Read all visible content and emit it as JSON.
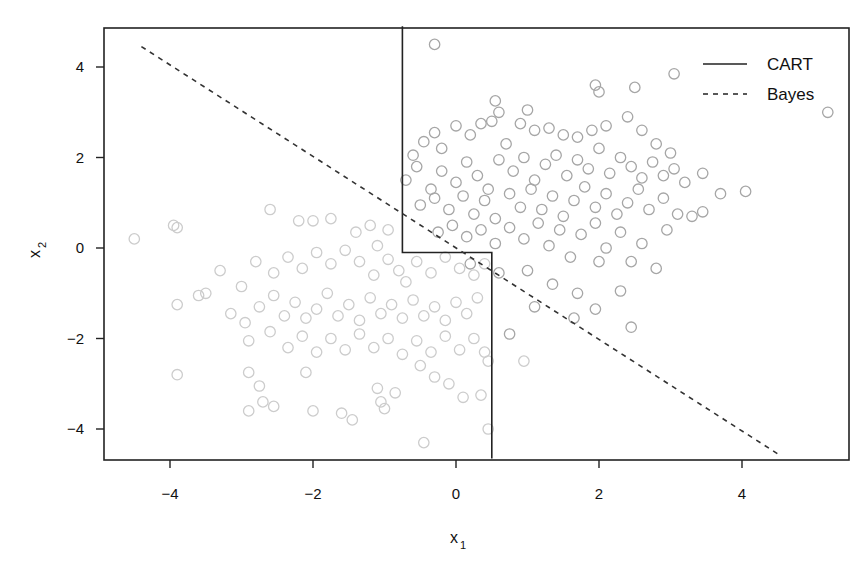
{
  "chart_data": {
    "type": "scatter",
    "title": "",
    "xlabel": "x",
    "xlabel_sub": "1",
    "ylabel": "x",
    "ylabel_sub": "2",
    "xlim": [
      -4.95,
      5.45
    ],
    "ylim": [
      -4.65,
      4.9
    ],
    "xticks": [
      -4,
      -2,
      0,
      2,
      4
    ],
    "xtick_labels": [
      "−4",
      "−2",
      "0",
      "2",
      "4"
    ],
    "yticks": [
      -4,
      -2,
      0,
      2,
      4
    ],
    "ytick_labels": [
      "−4",
      "−2",
      "0",
      "2",
      "4"
    ],
    "grid": false,
    "legend": {
      "position": "top-right",
      "entries": [
        {
          "label": "CART",
          "style": "solid"
        },
        {
          "label": "Bayes",
          "style": "dashed"
        }
      ]
    },
    "lines": [
      {
        "name": "CART",
        "style": "solid",
        "color": "#222222",
        "points": [
          [
            -0.75,
            4.9
          ],
          [
            -0.75,
            -0.1
          ],
          [
            0.5,
            -0.1
          ],
          [
            0.5,
            -4.65
          ]
        ]
      },
      {
        "name": "Bayes",
        "style": "dashed",
        "color": "#333333",
        "points": [
          [
            -4.4,
            4.45
          ],
          [
            4.55,
            -4.6
          ]
        ]
      }
    ],
    "series": [
      {
        "name": "class 1 (upper right)",
        "color": "#a6a6a6",
        "points": [
          [
            -0.3,
            4.5
          ],
          [
            0.55,
            3.25
          ],
          [
            0.6,
            3.0
          ],
          [
            1.0,
            3.05
          ],
          [
            1.95,
            3.6
          ],
          [
            2.0,
            3.45
          ],
          [
            2.5,
            3.55
          ],
          [
            3.05,
            3.85
          ],
          [
            5.2,
            3.0
          ],
          [
            -0.6,
            2.05
          ],
          [
            -0.45,
            2.35
          ],
          [
            -0.3,
            2.55
          ],
          [
            -0.2,
            2.2
          ],
          [
            0.0,
            2.7
          ],
          [
            0.2,
            2.5
          ],
          [
            0.35,
            2.75
          ],
          [
            0.5,
            2.8
          ],
          [
            0.7,
            2.3
          ],
          [
            0.9,
            2.75
          ],
          [
            1.1,
            2.6
          ],
          [
            1.3,
            2.65
          ],
          [
            1.5,
            2.5
          ],
          [
            1.7,
            2.45
          ],
          [
            1.9,
            2.6
          ],
          [
            2.1,
            2.7
          ],
          [
            2.4,
            2.9
          ],
          [
            2.6,
            2.6
          ],
          [
            2.8,
            2.3
          ],
          [
            3.0,
            2.1
          ],
          [
            -0.7,
            1.5
          ],
          [
            -0.55,
            1.8
          ],
          [
            -0.35,
            1.3
          ],
          [
            -0.2,
            1.7
          ],
          [
            0.0,
            1.45
          ],
          [
            0.15,
            1.9
          ],
          [
            0.3,
            1.6
          ],
          [
            0.45,
            1.3
          ],
          [
            0.6,
            1.95
          ],
          [
            0.8,
            1.7
          ],
          [
            0.95,
            2.0
          ],
          [
            1.1,
            1.5
          ],
          [
            1.25,
            1.85
          ],
          [
            1.4,
            2.05
          ],
          [
            1.55,
            1.6
          ],
          [
            1.7,
            1.95
          ],
          [
            1.85,
            1.75
          ],
          [
            2.0,
            2.2
          ],
          [
            2.15,
            1.65
          ],
          [
            2.3,
            2.0
          ],
          [
            2.45,
            1.8
          ],
          [
            2.6,
            1.55
          ],
          [
            2.75,
            1.9
          ],
          [
            2.9,
            1.6
          ],
          [
            3.05,
            1.75
          ],
          [
            3.2,
            1.45
          ],
          [
            3.45,
            1.65
          ],
          [
            3.7,
            1.2
          ],
          [
            4.05,
            1.25
          ],
          [
            -0.5,
            0.95
          ],
          [
            -0.3,
            1.1
          ],
          [
            -0.1,
            0.85
          ],
          [
            0.1,
            1.15
          ],
          [
            0.25,
            0.75
          ],
          [
            0.4,
            1.05
          ],
          [
            0.55,
            0.65
          ],
          [
            0.75,
            1.2
          ],
          [
            0.9,
            0.9
          ],
          [
            1.05,
            1.3
          ],
          [
            1.2,
            0.85
          ],
          [
            1.35,
            1.15
          ],
          [
            1.5,
            0.7
          ],
          [
            1.65,
            1.05
          ],
          [
            1.8,
            1.35
          ],
          [
            1.95,
            0.9
          ],
          [
            2.1,
            1.2
          ],
          [
            2.25,
            0.75
          ],
          [
            2.4,
            1.0
          ],
          [
            2.55,
            1.3
          ],
          [
            2.7,
            0.85
          ],
          [
            2.9,
            1.1
          ],
          [
            3.1,
            0.75
          ],
          [
            3.3,
            0.7
          ],
          [
            3.45,
            0.8
          ],
          [
            -0.25,
            0.35
          ],
          [
            -0.05,
            0.5
          ],
          [
            0.15,
            0.25
          ],
          [
            0.35,
            0.4
          ],
          [
            0.55,
            0.1
          ],
          [
            0.75,
            0.45
          ],
          [
            0.95,
            0.2
          ],
          [
            1.15,
            0.55
          ],
          [
            1.3,
            0.05
          ],
          [
            1.45,
            0.4
          ],
          [
            1.6,
            -0.2
          ],
          [
            1.75,
            0.3
          ],
          [
            1.95,
            0.55
          ],
          [
            2.1,
            0.0
          ],
          [
            2.3,
            0.35
          ],
          [
            2.45,
            -0.3
          ],
          [
            2.6,
            0.1
          ],
          [
            2.8,
            -0.45
          ],
          [
            2.95,
            0.4
          ],
          [
            0.2,
            -0.35
          ],
          [
            0.6,
            -0.55
          ],
          [
            1.0,
            -0.5
          ],
          [
            1.35,
            -0.8
          ],
          [
            1.7,
            -1.0
          ],
          [
            2.0,
            -0.3
          ],
          [
            2.3,
            -0.95
          ],
          [
            1.1,
            -1.3
          ],
          [
            1.95,
            -1.35
          ],
          [
            2.45,
            -1.75
          ],
          [
            0.75,
            -1.9
          ],
          [
            1.65,
            -1.55
          ]
        ]
      },
      {
        "name": "class 2 (lower left)",
        "color": "#cccccc",
        "points": [
          [
            -4.5,
            0.2
          ],
          [
            -3.95,
            0.5
          ],
          [
            -3.9,
            0.45
          ],
          [
            -2.6,
            0.85
          ],
          [
            -1.75,
            0.65
          ],
          [
            -2.0,
            0.6
          ],
          [
            -2.2,
            0.6
          ],
          [
            -1.4,
            0.35
          ],
          [
            -1.2,
            0.5
          ],
          [
            -0.95,
            0.4
          ],
          [
            -1.1,
            0.05
          ],
          [
            -3.3,
            -0.5
          ],
          [
            -3.0,
            -0.85
          ],
          [
            -2.8,
            -0.3
          ],
          [
            -2.55,
            -0.55
          ],
          [
            -2.35,
            -0.2
          ],
          [
            -2.15,
            -0.45
          ],
          [
            -1.95,
            -0.1
          ],
          [
            -1.75,
            -0.35
          ],
          [
            -1.55,
            -0.05
          ],
          [
            -1.35,
            -0.3
          ],
          [
            -1.15,
            -0.6
          ],
          [
            -0.95,
            -0.25
          ],
          [
            -0.8,
            -0.5
          ],
          [
            -0.7,
            -0.75
          ],
          [
            -0.55,
            -0.3
          ],
          [
            -0.35,
            -0.55
          ],
          [
            -0.15,
            -0.2
          ],
          [
            0.05,
            -0.45
          ],
          [
            0.25,
            -0.6
          ],
          [
            0.4,
            -0.35
          ],
          [
            -3.9,
            -1.25
          ],
          [
            -3.6,
            -1.05
          ],
          [
            -3.5,
            -1.0
          ],
          [
            -3.15,
            -1.45
          ],
          [
            -2.95,
            -1.65
          ],
          [
            -2.75,
            -1.3
          ],
          [
            -2.55,
            -1.05
          ],
          [
            -2.4,
            -1.5
          ],
          [
            -2.25,
            -1.2
          ],
          [
            -2.1,
            -1.55
          ],
          [
            -1.95,
            -1.35
          ],
          [
            -1.8,
            -1.0
          ],
          [
            -1.65,
            -1.5
          ],
          [
            -1.5,
            -1.25
          ],
          [
            -1.35,
            -1.6
          ],
          [
            -1.2,
            -1.1
          ],
          [
            -1.05,
            -1.45
          ],
          [
            -0.9,
            -1.25
          ],
          [
            -0.75,
            -1.55
          ],
          [
            -0.6,
            -1.15
          ],
          [
            -0.45,
            -1.5
          ],
          [
            -0.3,
            -1.3
          ],
          [
            -0.15,
            -1.6
          ],
          [
            0.0,
            -1.2
          ],
          [
            0.15,
            -1.45
          ],
          [
            0.3,
            -1.1
          ],
          [
            -2.9,
            -2.05
          ],
          [
            -2.6,
            -1.85
          ],
          [
            -2.35,
            -2.2
          ],
          [
            -2.15,
            -1.95
          ],
          [
            -1.95,
            -2.3
          ],
          [
            -1.75,
            -2.0
          ],
          [
            -1.55,
            -2.25
          ],
          [
            -1.35,
            -1.9
          ],
          [
            -1.15,
            -2.2
          ],
          [
            -0.95,
            -2.0
          ],
          [
            -0.75,
            -2.35
          ],
          [
            -0.55,
            -2.05
          ],
          [
            -0.35,
            -2.3
          ],
          [
            -0.15,
            -1.95
          ],
          [
            0.05,
            -2.25
          ],
          [
            0.25,
            -2.0
          ],
          [
            0.4,
            -2.3
          ],
          [
            -2.9,
            -2.75
          ],
          [
            -2.75,
            -3.05
          ],
          [
            -2.7,
            -3.4
          ],
          [
            -2.9,
            -3.6
          ],
          [
            -2.55,
            -3.5
          ],
          [
            -2.0,
            -3.6
          ],
          [
            -1.6,
            -3.65
          ],
          [
            -1.45,
            -3.8
          ],
          [
            -1.1,
            -3.1
          ],
          [
            -1.05,
            -3.4
          ],
          [
            -1.0,
            -3.55
          ],
          [
            -0.85,
            -3.2
          ],
          [
            -0.5,
            -2.6
          ],
          [
            -0.3,
            -2.85
          ],
          [
            -0.1,
            -3.0
          ],
          [
            0.1,
            -3.3
          ],
          [
            0.35,
            -3.25
          ],
          [
            0.45,
            -4.0
          ],
          [
            0.45,
            -2.5
          ],
          [
            0.95,
            -2.5
          ],
          [
            -0.45,
            -4.3
          ],
          [
            -3.9,
            -2.8
          ],
          [
            -2.1,
            -2.75
          ]
        ]
      }
    ]
  },
  "legend": {
    "cart_label": "CART",
    "bayes_label": "Bayes"
  },
  "axes": {
    "x_label": "x",
    "x_label_sub": "1",
    "y_label": "x",
    "y_label_sub": "2"
  }
}
